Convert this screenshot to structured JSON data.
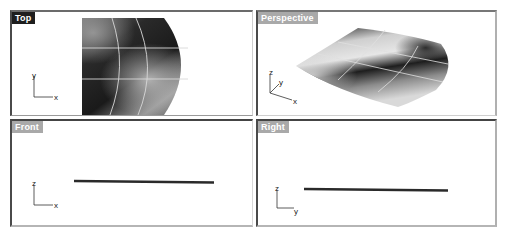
{
  "viewports": {
    "top": {
      "label": "Top",
      "active": true,
      "axis_vertical": "y",
      "axis_horizontal": "x"
    },
    "perspective": {
      "label": "Perspective",
      "active": false,
      "axis_vertical": "z",
      "axis_depth": "y",
      "axis_horizontal": "x"
    },
    "front": {
      "label": "Front",
      "active": false,
      "axis_vertical": "z",
      "axis_horizontal": "x"
    },
    "right": {
      "label": "Right",
      "active": false,
      "axis_vertical": "z",
      "axis_horizontal": "y"
    }
  },
  "colors": {
    "active_label_bg": "#1e1e1e",
    "inactive_label_bg": "#a9a9a9",
    "curve_color": "#2a2a2a",
    "isocurve_color": "#d8d8d8"
  }
}
